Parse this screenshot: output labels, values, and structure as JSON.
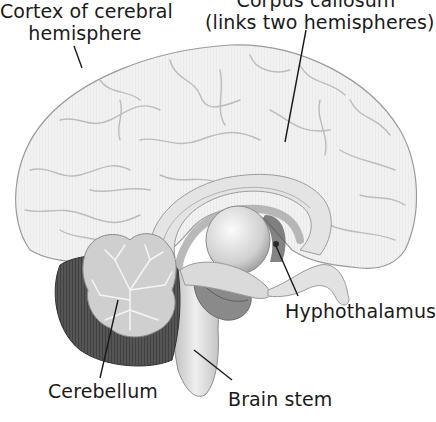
{
  "diagram": {
    "labels": {
      "corpus_callosum": {
        "line1": "Corpus callosum",
        "line2": "(links two hemispheres)"
      },
      "cortex": {
        "line1": "Cortex of cerebral",
        "line2": "hemisphere"
      },
      "hypothalamus": "Hyphothalamus",
      "cerebellum": "Cerebellum",
      "brain_stem": "Brain stem"
    },
    "colors": {
      "background": "#ffffff",
      "cortex_fill": "#efefef",
      "sulci": "#b8b8b8",
      "cerebellum_dark": "#4a4a4a",
      "arbor_vitae": "#d6d6d6",
      "leader_line": "#1a1a1a",
      "text": "#1a1a1a"
    }
  }
}
